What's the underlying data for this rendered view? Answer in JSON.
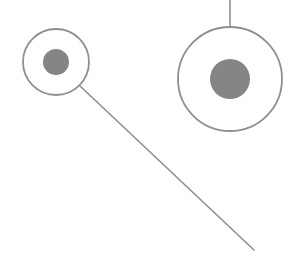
{
  "diagram": {
    "colors": {
      "stroke": "#8f8f8f",
      "fill": "#858585",
      "background": "#ffffff"
    },
    "nodes": [
      {
        "id": "left-node",
        "cx": 56,
        "cy": 62,
        "outer_r": 33,
        "inner_r": 13
      },
      {
        "id": "right-node",
        "cx": 230,
        "cy": 79,
        "outer_r": 52,
        "inner_r": 20
      }
    ],
    "edges": [
      {
        "id": "left-diagonal",
        "x1": 80,
        "y1": 86,
        "x2": 254,
        "y2": 250
      },
      {
        "id": "right-vertical",
        "x1": 230,
        "y1": 0,
        "x2": 230,
        "y2": 27
      }
    ]
  }
}
